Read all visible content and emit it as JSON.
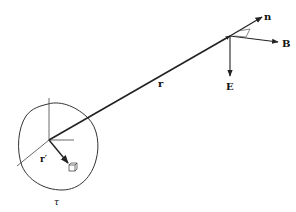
{
  "diagram": {
    "type": "physics-radiation-geometry",
    "labels": {
      "n": "n",
      "B": "B",
      "E": "E",
      "r": "r",
      "r_prime": "r′",
      "tau": "τ"
    },
    "colors": {
      "stroke": "#222222",
      "background": "#ffffff"
    }
  }
}
